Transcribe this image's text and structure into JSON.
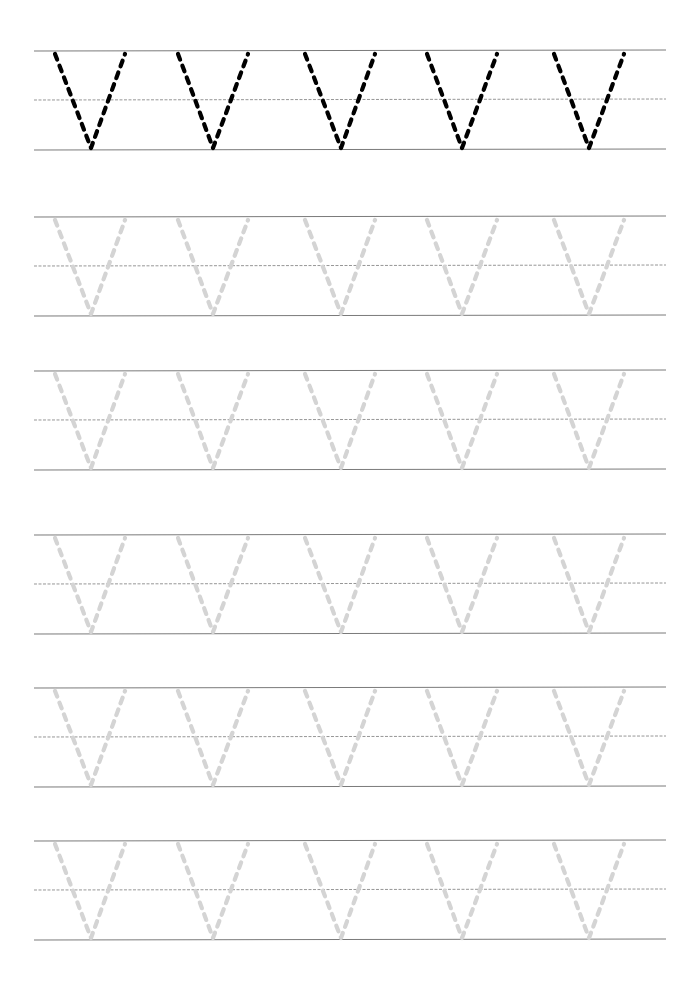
{
  "worksheet": {
    "letter": "v",
    "letters_per_row": 5,
    "colors": {
      "guide_line": "#7a7a7a",
      "mid_line": "#8a8a8a",
      "model_letter": "#000000",
      "trace_letter": "#d4d4d4",
      "background": "#ffffff"
    },
    "rows": [
      {
        "type": "model",
        "top": 51,
        "mid": 100,
        "bottom": 150
      },
      {
        "type": "trace",
        "top": 217,
        "mid": 266,
        "bottom": 316
      },
      {
        "type": "trace",
        "top": 371,
        "mid": 420,
        "bottom": 470
      },
      {
        "type": "trace",
        "top": 535,
        "mid": 584,
        "bottom": 634
      },
      {
        "type": "trace",
        "top": 688,
        "mid": 737,
        "bottom": 787
      },
      {
        "type": "trace",
        "top": 841,
        "mid": 890,
        "bottom": 940
      }
    ],
    "letter_positions": [
      {
        "left": 55,
        "apex": 91,
        "right": 125
      },
      {
        "left": 178,
        "apex": 213,
        "right": 248
      },
      {
        "left": 305,
        "apex": 341,
        "right": 375
      },
      {
        "left": 427,
        "apex": 462,
        "right": 497
      },
      {
        "left": 554,
        "apex": 589,
        "right": 624
      }
    ],
    "line_x_start": 34,
    "line_x_end": 666
  }
}
